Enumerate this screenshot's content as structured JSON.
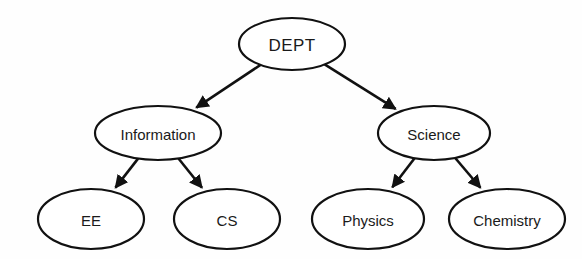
{
  "diagram": {
    "type": "tree",
    "background_color": "#fefefe",
    "stroke_color": "#111111",
    "text_color": "#1a1a1a",
    "node_fill": "#ffffff",
    "nodes": [
      {
        "id": "dept",
        "label": "DEPT",
        "level": 0,
        "cx": 292,
        "cy": 44,
        "rx": 53,
        "ry": 26
      },
      {
        "id": "information",
        "label": "Information",
        "level": 1,
        "cx": 158,
        "cy": 133,
        "rx": 63,
        "ry": 27
      },
      {
        "id": "science",
        "label": "Science",
        "level": 1,
        "cx": 434,
        "cy": 133,
        "rx": 56,
        "ry": 27
      },
      {
        "id": "ee",
        "label": "EE",
        "level": 2,
        "cx": 91,
        "cy": 219,
        "rx": 53,
        "ry": 30
      },
      {
        "id": "cs",
        "label": "CS",
        "level": 2,
        "cx": 227,
        "cy": 219,
        "rx": 53,
        "ry": 30
      },
      {
        "id": "physics",
        "label": "Physics",
        "level": 2,
        "cx": 368,
        "cy": 219,
        "rx": 56,
        "ry": 30
      },
      {
        "id": "chemistry",
        "label": "Chemistry",
        "level": 2,
        "cx": 507,
        "cy": 219,
        "rx": 58,
        "ry": 30
      }
    ],
    "edges": [
      {
        "id": "dept-information",
        "from": "dept",
        "to": "information",
        "arrow": true
      },
      {
        "id": "dept-science",
        "from": "dept",
        "to": "science",
        "arrow": true
      },
      {
        "id": "information-ee",
        "from": "information",
        "to": "ee",
        "arrow": true
      },
      {
        "id": "information-cs",
        "from": "information",
        "to": "cs",
        "arrow": true
      },
      {
        "id": "science-physics",
        "from": "science",
        "to": "physics",
        "arrow": true
      },
      {
        "id": "science-chemistry",
        "from": "science",
        "to": "chemistry",
        "arrow": true
      }
    ]
  }
}
